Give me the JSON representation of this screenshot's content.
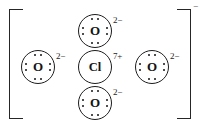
{
  "figure": {
    "background_color": "#ffffff",
    "ink_color": "#1d1d1d",
    "bracket": {
      "left_glyph": "[",
      "right_glyph": "]",
      "overall_charge": "−"
    }
  },
  "atoms": [
    {
      "id": "top",
      "symbol": "O",
      "charge": "2−",
      "lone_pair_dots": 8,
      "position": "top"
    },
    {
      "id": "left",
      "symbol": "O",
      "charge": "2−",
      "lone_pair_dots": 8,
      "position": "left"
    },
    {
      "id": "center",
      "symbol": "Cl",
      "charge": "7+",
      "lone_pair_dots": 0,
      "position": "center"
    },
    {
      "id": "right",
      "symbol": "O",
      "charge": "2−",
      "lone_pair_dots": 8,
      "position": "right"
    },
    {
      "id": "bottom",
      "symbol": "O",
      "charge": "2−",
      "lone_pair_dots": 8,
      "position": "bottom"
    }
  ]
}
